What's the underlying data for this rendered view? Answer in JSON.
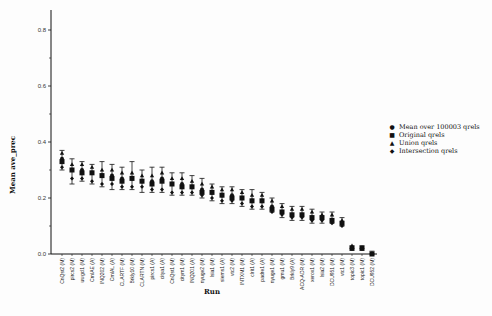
{
  "chart_data": {
    "type": "scatter",
    "title": "",
    "xlabel": "Run",
    "ylabel": "Mean ave_prec",
    "ylim": [
      0.0,
      0.85
    ],
    "yticks": [
      0.0,
      0.2,
      0.4,
      0.6,
      0.8
    ],
    "ytick_labels": [
      "0.0",
      "0.2",
      "0.4",
      "0.6",
      "0.8"
    ],
    "grid": false,
    "legend_position": "right",
    "categories": [
      "CnQst2 (M)",
      "pircs2 (M)",
      "uwgcl1 (M)",
      "CrnlAE (A)",
      "INQ202 (M)",
      "CrnlAL (A)",
      "CLARTF (M)",
      "Brkly10 (M)",
      "CLARTN (M)",
      "pircs1 (A)",
      "citya1 (A)",
      "CnQst1 (M)",
      "citym1 (M)",
      "INQ201 (A)",
      "nyuge2 (M)",
      "lsia1 (M)",
      "siems1 (A)",
      "vtc2 (M)",
      "INTXM1 (M)",
      "clrit1 (A)",
      "padre1 (A)",
      "nyuge1 (M)",
      "gmu1 (M)",
      "Brkly9 (A)",
      "ACQ-ADR (M)",
      "xerox1 (M)",
      "lsia2 (M)",
      "DCU951 (M)",
      "vtc1 (M)",
      "topic3 (M)",
      "topic1 (M)",
      "DCU952 (M)"
    ],
    "series": [
      {
        "name": "Mean over 100003 qrels",
        "marker": "circle",
        "values": [
          0.34,
          0.3,
          0.3,
          0.29,
          0.28,
          0.28,
          0.27,
          0.27,
          0.26,
          0.26,
          0.27,
          0.25,
          0.25,
          0.24,
          0.23,
          0.22,
          0.21,
          0.21,
          0.2,
          0.19,
          0.19,
          0.17,
          0.15,
          0.14,
          0.14,
          0.13,
          0.13,
          0.12,
          0.11,
          0.02,
          0.02,
          0.0
        ],
        "error_low": [
          0.3,
          0.25,
          0.26,
          0.25,
          0.24,
          0.23,
          0.23,
          0.23,
          0.22,
          0.22,
          0.22,
          0.21,
          0.21,
          0.21,
          0.2,
          0.19,
          0.18,
          0.18,
          0.17,
          0.16,
          0.16,
          0.15,
          0.13,
          0.12,
          0.12,
          0.11,
          0.11,
          0.11,
          0.1,
          0.02,
          0.02,
          0.0
        ],
        "error_high": [
          0.37,
          0.34,
          0.33,
          0.32,
          0.33,
          0.32,
          0.31,
          0.33,
          0.3,
          0.31,
          0.31,
          0.29,
          0.29,
          0.28,
          0.27,
          0.25,
          0.24,
          0.24,
          0.23,
          0.23,
          0.22,
          0.2,
          0.18,
          0.17,
          0.17,
          0.16,
          0.15,
          0.15,
          0.13,
          0.03,
          0.03,
          0.01
        ]
      },
      {
        "name": "Original qrels",
        "marker": "square",
        "values": [
          0.33,
          0.3,
          0.29,
          0.29,
          0.28,
          0.27,
          0.26,
          0.27,
          0.26,
          0.25,
          0.26,
          0.25,
          0.24,
          0.24,
          0.22,
          0.22,
          0.21,
          0.2,
          0.2,
          0.19,
          0.19,
          0.16,
          0.15,
          0.14,
          0.14,
          0.13,
          0.13,
          0.12,
          0.11,
          0.02,
          0.02,
          0.0
        ]
      },
      {
        "name": "Union qrels",
        "marker": "triangle",
        "values": [
          0.36,
          0.32,
          0.32,
          0.31,
          0.3,
          0.3,
          0.29,
          0.29,
          0.28,
          0.28,
          0.29,
          0.27,
          0.27,
          0.26,
          0.25,
          0.24,
          0.23,
          0.23,
          0.22,
          0.21,
          0.21,
          0.19,
          0.17,
          0.16,
          0.16,
          0.15,
          0.14,
          0.14,
          0.12,
          0.03,
          0.02,
          0.0
        ]
      },
      {
        "name": "Intersection qrels",
        "marker": "diamond",
        "values": [
          0.31,
          0.27,
          0.27,
          0.26,
          0.25,
          0.25,
          0.24,
          0.24,
          0.24,
          0.23,
          0.23,
          0.22,
          0.22,
          0.22,
          0.21,
          0.2,
          0.19,
          0.19,
          0.18,
          0.17,
          0.17,
          0.15,
          0.14,
          0.13,
          0.13,
          0.12,
          0.12,
          0.11,
          0.1,
          0.02,
          0.02,
          0.0
        ]
      }
    ]
  },
  "legend": {
    "items": [
      {
        "symbol": "●",
        "label": "Mean over 100003 qrels"
      },
      {
        "symbol": "■",
        "label": "Original qrels"
      },
      {
        "symbol": "▲",
        "label": "Union qrels"
      },
      {
        "symbol": "◆",
        "label": "Intersection qrels"
      }
    ]
  },
  "axes": {
    "y_title": "Mean ave_prec",
    "x_title": "Run"
  },
  "colors": {
    "ink": "#111111",
    "background": "#fdfdfd"
  }
}
